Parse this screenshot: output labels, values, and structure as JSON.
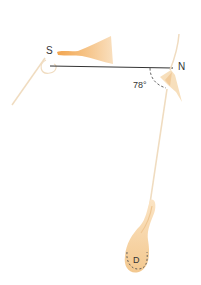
{
  "figure": {
    "top_cut_text": "",
    "labels": {
      "south": "S",
      "north": "N",
      "angle": "78°",
      "pole_d": "D"
    },
    "colors": {
      "baseline": "#333333",
      "fiber": "#f0dcc0",
      "fiber_dark": "#e9c9a0",
      "cone_light": "#f7d3a6",
      "cone_dark": "#f2a54f",
      "body_d": "#f5cf9c",
      "dashed": "#555555"
    }
  }
}
